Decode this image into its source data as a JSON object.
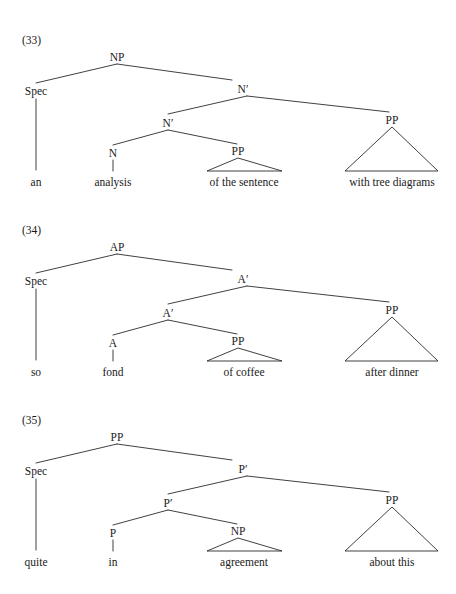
{
  "page": {
    "background_color": "#ffffff",
    "line_color": "#2b2b2b",
    "text_color": "#1a1a1a",
    "width": 456,
    "height": 594
  },
  "diagrams": [
    {
      "number": "(33)",
      "root": "NP",
      "spec_label": "Spec",
      "bar_upper": "N′",
      "bar_lower": "N′",
      "head": "N",
      "complement_node": "PP",
      "adjunct_node": "PP",
      "spec_word": "an",
      "head_word": "analysis",
      "complement_words": "of the sentence",
      "adjunct_words": "with tree diagrams"
    },
    {
      "number": "(34)",
      "root": "AP",
      "spec_label": "Spec",
      "bar_upper": "A′",
      "bar_lower": "A′",
      "head": "A",
      "complement_node": "PP",
      "adjunct_node": "PP",
      "spec_word": "so",
      "head_word": "fond",
      "complement_words": "of coffee",
      "adjunct_words": "after dinner"
    },
    {
      "number": "(35)",
      "root": "PP",
      "spec_label": "Spec",
      "bar_upper": "P′",
      "bar_lower": "P′",
      "head": "P",
      "complement_node": "NP",
      "adjunct_node": "PP",
      "spec_word": "quite",
      "head_word": "in",
      "complement_words": "agreement",
      "adjunct_words": "about this"
    }
  ]
}
